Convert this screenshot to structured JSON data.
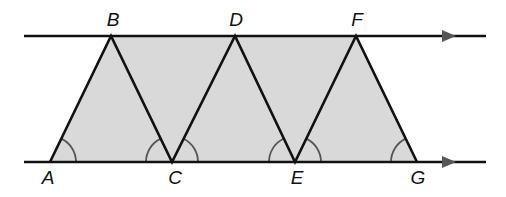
{
  "figure": {
    "type": "geometry-diagram",
    "colors": {
      "line": "#111111",
      "fill": "#d9d9d9",
      "arc": "#555555",
      "arrow": "#555555",
      "background": "#ffffff"
    },
    "lines": {
      "top": {
        "x1": 24,
        "x2": 486,
        "y": 36,
        "arrow_x": 449
      },
      "bottom": {
        "x1": 24,
        "x2": 486,
        "y": 162,
        "arrow_x": 449
      }
    },
    "points": [
      {
        "label": "A",
        "x": 50,
        "y": 162,
        "label_x": 48,
        "label_y": 168
      },
      {
        "label": "B",
        "x": 111,
        "y": 36,
        "label_x": 113,
        "label_y": 10
      },
      {
        "label": "C",
        "x": 172,
        "y": 162,
        "label_x": 175,
        "label_y": 168
      },
      {
        "label": "D",
        "x": 235,
        "y": 36,
        "label_x": 236,
        "label_y": 10
      },
      {
        "label": "E",
        "x": 295,
        "y": 162,
        "label_x": 297,
        "label_y": 168
      },
      {
        "label": "F",
        "x": 356,
        "y": 36,
        "label_x": 357,
        "label_y": 10
      },
      {
        "label": "G",
        "x": 417,
        "y": 162,
        "label_x": 418,
        "label_y": 168
      }
    ],
    "segments": [
      "AB",
      "BC",
      "CD",
      "DE",
      "EF",
      "FG"
    ],
    "shaded_polygon": [
      "A",
      "B",
      "F",
      "G"
    ],
    "angle_marks": [
      {
        "vertex": "A",
        "from": "AC",
        "to": "AB"
      },
      {
        "vertex": "C",
        "from": "CA",
        "to": "CB"
      },
      {
        "vertex": "C",
        "from": "CE",
        "to": "CD"
      },
      {
        "vertex": "E",
        "from": "EC",
        "to": "ED"
      },
      {
        "vertex": "E",
        "from": "EG",
        "to": "EF"
      },
      {
        "vertex": "G",
        "from": "GE",
        "to": "GF"
      }
    ]
  },
  "labels": {
    "A": "A",
    "B": "B",
    "C": "C",
    "D": "D",
    "E": "E",
    "F": "F",
    "G": "G"
  }
}
